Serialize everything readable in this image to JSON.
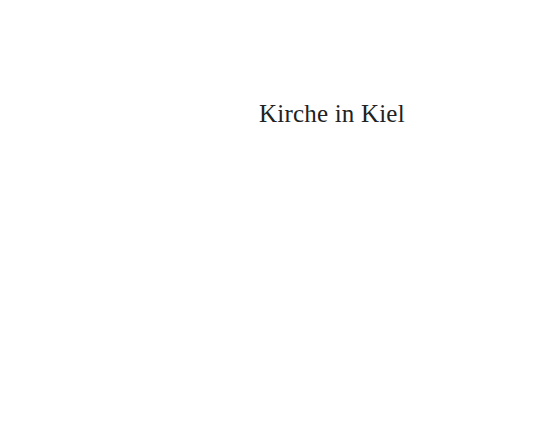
{
  "page": {
    "title": "Kirche in Kiel",
    "background_color": "#ffffff",
    "text_color": "#222222"
  }
}
